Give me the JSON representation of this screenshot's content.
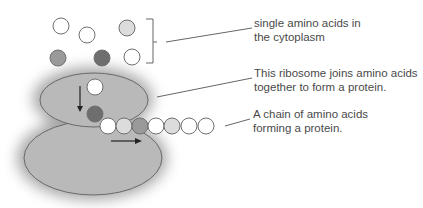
{
  "diagram": {
    "colors": {
      "ribosome_fill": "#b9b9b9",
      "ribosome_stroke": "#6a6a6a",
      "shadow": "#8a8a8a",
      "white_acid": "#ffffff",
      "light_acid": "#dcdcdc",
      "mid_acid": "#9a9a9a",
      "dark_acid": "#6e6e6e",
      "acid_stroke": "#707070",
      "leader_line": "#666666",
      "arrow": "#222222",
      "text": "#4a4a4a"
    },
    "free_amino_acids": [
      {
        "cx": 61,
        "cy": 26,
        "shade": "white"
      },
      {
        "cx": 87,
        "cy": 35,
        "shade": "white"
      },
      {
        "cx": 127,
        "cy": 28,
        "shade": "light"
      },
      {
        "cx": 58,
        "cy": 58,
        "shade": "mid"
      },
      {
        "cx": 102,
        "cy": 58,
        "shade": "dark"
      },
      {
        "cx": 132,
        "cy": 57,
        "shade": "white"
      }
    ],
    "ribosome_acids": [
      {
        "cx": 95,
        "cy": 87,
        "shade": "white"
      },
      {
        "cx": 95,
        "cy": 114,
        "shade": "dark"
      }
    ],
    "chain": [
      {
        "cx": 108,
        "cy": 126,
        "shade": "white"
      },
      {
        "cx": 124,
        "cy": 126,
        "shade": "light"
      },
      {
        "cx": 140,
        "cy": 126,
        "shade": "mid"
      },
      {
        "cx": 156,
        "cy": 126,
        "shade": "white"
      },
      {
        "cx": 172,
        "cy": 126,
        "shade": "light"
      },
      {
        "cx": 189,
        "cy": 126,
        "shade": "white"
      },
      {
        "cx": 206,
        "cy": 126,
        "shade": "white"
      }
    ],
    "labels": [
      {
        "id": "free",
        "line1": "single amino acids in",
        "line2": "the cytoplasm"
      },
      {
        "id": "ribosome",
        "line1": "This ribosome joins amino acids",
        "line2": "together to form a protein."
      },
      {
        "id": "chain",
        "line1": "A chain of amino acids",
        "line2": "forming a protein."
      }
    ]
  }
}
